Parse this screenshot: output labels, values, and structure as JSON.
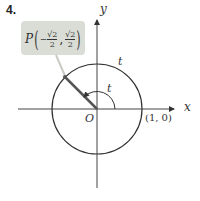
{
  "problem_number": "4.",
  "figure": {
    "point_label": "P",
    "point_x_sign": "−",
    "point_x_num": "√2",
    "point_x_den": "2",
    "point_y_num": "√2",
    "point_y_den": "2",
    "arc_label_outer": "t",
    "angle_label": "t",
    "origin_label": "O",
    "x_axis_label": "x",
    "y_axis_label": "y",
    "unit_point_label": "(1, 0)",
    "colors": {
      "callout_bg": "#d9ddd6",
      "circle": "#333333",
      "radius": "#555555",
      "axis": "#444444"
    }
  }
}
